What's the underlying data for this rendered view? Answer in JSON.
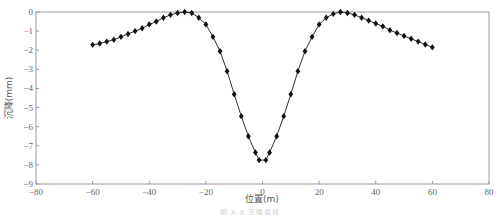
{
  "chart_data": {
    "type": "line",
    "title": "",
    "xlabel": "位置(m)",
    "ylabel": "沉降(mm)",
    "xlim": [
      -80,
      80
    ],
    "ylim": [
      -9,
      0
    ],
    "xticks": [
      -80,
      -60,
      -40,
      -20,
      0,
      20,
      40,
      60,
      80
    ],
    "yticks": [
      0,
      -1,
      -2,
      -3,
      -4,
      -5,
      -6,
      -7,
      -8,
      -9
    ],
    "grid": false,
    "legend": null,
    "marker": "diamond",
    "series": [
      {
        "name": "沉降",
        "color": "#111111",
        "x": [
          -60,
          -57.5,
          -55,
          -52.5,
          -50,
          -47.5,
          -45,
          -42.5,
          -40,
          -37.5,
          -35,
          -32.5,
          -30,
          -27.5,
          -25,
          -22.5,
          -20,
          -17.5,
          -15,
          -12.5,
          -10,
          -7.5,
          -5,
          -2.5,
          -1.2,
          1.2,
          2.5,
          5,
          7.5,
          10,
          12.5,
          15,
          17.5,
          20,
          22.5,
          25,
          27.5,
          30,
          32.5,
          35,
          37.5,
          40,
          42.5,
          45,
          47.5,
          50,
          52.5,
          55,
          57.5,
          60
        ],
        "y": [
          -1.72,
          -1.65,
          -1.55,
          -1.45,
          -1.3,
          -1.15,
          -1.0,
          -0.85,
          -0.65,
          -0.5,
          -0.3,
          -0.15,
          -0.05,
          0.0,
          -0.05,
          -0.3,
          -0.65,
          -1.3,
          -2.05,
          -3.1,
          -4.3,
          -5.45,
          -6.5,
          -7.35,
          -7.75,
          -7.75,
          -7.35,
          -6.5,
          -5.45,
          -4.3,
          -3.1,
          -2.05,
          -1.3,
          -0.65,
          -0.3,
          -0.1,
          0.0,
          -0.05,
          -0.15,
          -0.3,
          -0.45,
          -0.6,
          -0.75,
          -0.95,
          -1.1,
          -1.25,
          -1.4,
          -1.55,
          -1.7,
          -1.85
        ]
      }
    ]
  },
  "caption": "图 X-X 沉降曲线"
}
